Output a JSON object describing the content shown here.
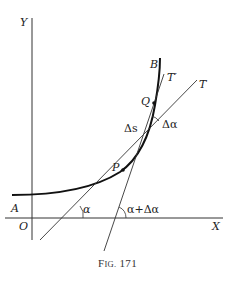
{
  "figure": {
    "caption_prefix": "F",
    "caption_smallcaps": "IG.",
    "caption_number": "171",
    "axes": {
      "x_label": "X",
      "y_label": "Y",
      "origin_label": "O"
    },
    "points": {
      "A": "A",
      "B": "B",
      "P": "P",
      "Q": "Q"
    },
    "lines": {
      "T": "T",
      "T_prime": "T′"
    },
    "annotations": {
      "delta_s": "Δs",
      "delta_alpha": "Δα",
      "alpha": "α",
      "alpha_plus_delta_alpha": "α+Δα"
    },
    "colors": {
      "ink": "#222222",
      "background": "#ffffff"
    }
  }
}
